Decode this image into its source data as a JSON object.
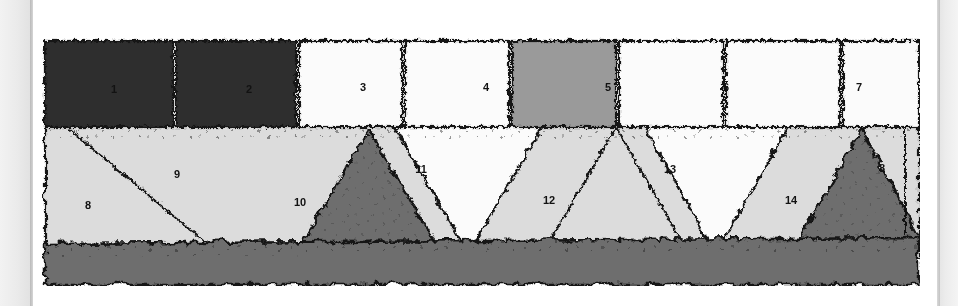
{
  "figure": {
    "background_color": "#ffffff",
    "ink_color": "#121212",
    "page_edge": {
      "left_gutter_color": "#eaeaea",
      "left_gutter_line_color": "#b9b9b9",
      "right_gutter_color": "#ececec",
      "right_gutter_line_color": "#c2c2c2"
    },
    "fills": {
      "dark": "#2e2e2e",
      "mid_dark": "#6e6e6e",
      "mid": "#9a9a9a",
      "light": "#dcdcdc",
      "white": "#fbfbfb",
      "basal": "#6e6e6e"
    },
    "top_row": {
      "name": "upper-block-row",
      "blocks": [
        {
          "label": "1",
          "fill": "dark",
          "x": 0,
          "width": 128
        },
        {
          "label": "2",
          "fill": "dark",
          "x": 130,
          "width": 121
        },
        {
          "label": "3",
          "fill": "white",
          "x": 253,
          "width": 105
        },
        {
          "label": "4",
          "fill": "white",
          "x": 360,
          "width": 105
        },
        {
          "label": "5",
          "fill": "mid",
          "x": 467,
          "width": 105
        },
        {
          "label": "6",
          "fill": "white",
          "x": 574,
          "width": 105
        },
        {
          "label": "7",
          "fill": "white",
          "x": 681,
          "width": 115
        }
      ]
    },
    "middle_row": {
      "name": "wedge-row",
      "wedges": [
        {
          "label": "8",
          "fill": "light",
          "shape": "left-edge-wedge"
        },
        {
          "label": "9",
          "fill": "light",
          "shape": "inverted-triangle"
        },
        {
          "label": "10",
          "fill": "mid_dark",
          "shape": "triangle"
        },
        {
          "label": "11",
          "fill": "white",
          "shape": "inverted-triangle"
        },
        {
          "label": "12",
          "fill": "light",
          "shape": "triangle"
        },
        {
          "label": "13",
          "fill": "white",
          "shape": "inverted-triangle"
        },
        {
          "label": "14",
          "fill": "mid_dark",
          "shape": "triangle"
        },
        {
          "label": "8",
          "fill": "light",
          "shape": "right-edge-wedge"
        }
      ]
    },
    "basal_layer": {
      "name": "basal-band",
      "fill": "mid_dark",
      "label": ""
    },
    "labels": [
      {
        "text": "1",
        "x": 114,
        "y": 90
      },
      {
        "text": "2",
        "x": 249,
        "y": 90
      },
      {
        "text": "3",
        "x": 363,
        "y": 88
      },
      {
        "text": "4",
        "x": 486,
        "y": 88
      },
      {
        "text": "5",
        "x": 608,
        "y": 88
      },
      {
        "text": "6",
        "x": 726,
        "y": 88
      },
      {
        "text": "7",
        "x": 859,
        "y": 88
      },
      {
        "text": "8",
        "x": 88,
        "y": 206
      },
      {
        "text": "9",
        "x": 177,
        "y": 175
      },
      {
        "text": "10",
        "x": 300,
        "y": 203
      },
      {
        "text": "11",
        "x": 421,
        "y": 170
      },
      {
        "text": "12",
        "x": 549,
        "y": 201
      },
      {
        "text": "13",
        "x": 670,
        "y": 170
      },
      {
        "text": "14",
        "x": 791,
        "y": 201
      },
      {
        "text": "8",
        "x": 882,
        "y": 169
      }
    ]
  }
}
